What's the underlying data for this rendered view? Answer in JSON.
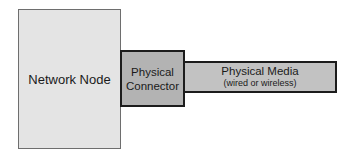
{
  "diagram": {
    "node": {
      "label": "Network Node",
      "fill": "#e4e4e4"
    },
    "connector": {
      "line1": "Physical",
      "line2": "Connector",
      "fill": "#b3b3b3"
    },
    "media": {
      "label": "Physical Media",
      "sublabel": "(wired or wireless)",
      "fill": "#c2c2c2"
    }
  }
}
